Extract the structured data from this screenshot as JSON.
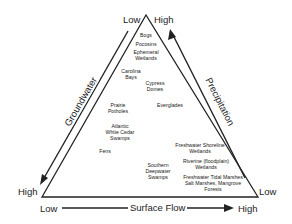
{
  "diagram": {
    "type": "ternary triangle",
    "apex": {
      "left_label": "Low",
      "right_label": "High"
    },
    "left_axis": {
      "name": "Groundwater",
      "bottom_label": "High"
    },
    "right_axis": {
      "name": "Precipitation",
      "bottom_label": "Low"
    },
    "bottom_axis": {
      "name": "Surface Flow",
      "start_label": "Low",
      "end_label": "High"
    },
    "wetlands": [
      {
        "name": "Bogs"
      },
      {
        "name": "Pocosins"
      },
      {
        "name": "Ephemeral\nWetlands"
      },
      {
        "name": "Carolina\nBays"
      },
      {
        "name": "Cypress\nDomes"
      },
      {
        "name": "Prairie\nPotholes"
      },
      {
        "name": "Everglades"
      },
      {
        "name": "Atlantic\nWhite Cedar\nSwamps"
      },
      {
        "name": "Fens"
      },
      {
        "name": "Southern\nDeepwater\nSwamps"
      },
      {
        "name": "Freshwater Shoreline\nWetlands"
      },
      {
        "name": "Riverine (floodplain)\nWetlands"
      },
      {
        "name": "Freshwater Tidal Marshes\nSalt Marshes, Mangrove\nForests"
      }
    ]
  }
}
